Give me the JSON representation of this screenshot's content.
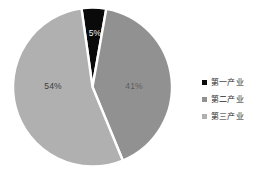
{
  "chart_data": {
    "type": "pie",
    "title": "",
    "subtitle": "",
    "xlabel": "",
    "ylabel": "",
    "grid": false,
    "legend_position": "right",
    "start_angle_deg": -8,
    "direction": "clockwise",
    "categories": [
      "第一产业",
      "第二产业",
      "第三产业"
    ],
    "values": [
      5,
      41,
      54
    ],
    "value_labels": [
      "5%",
      "41%",
      "54%"
    ],
    "colors": [
      "#0a0a0a",
      "#919191",
      "#b0b0b0"
    ],
    "separator_color": "#ffffff",
    "background": "#ffffff",
    "slices": [
      {
        "name": "第一产业",
        "value": 5,
        "label": "5%",
        "color": "#0a0a0a"
      },
      {
        "name": "第二产业",
        "value": 41,
        "label": "41%",
        "color": "#919191"
      },
      {
        "name": "第三产业",
        "value": 54,
        "label": "54%",
        "color": "#b0b0b0"
      }
    ]
  },
  "legend": {
    "items": [
      {
        "label": "第一产业",
        "color": "#0a0a0a"
      },
      {
        "label": "第二产业",
        "color": "#919191"
      },
      {
        "label": "第三产业",
        "color": "#b0b0b0"
      }
    ]
  }
}
